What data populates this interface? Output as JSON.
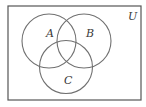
{
  "diagram": {
    "type": "venn",
    "universe": {
      "label": "U",
      "rect": {
        "x": 8,
        "y": 6,
        "width": 133,
        "height": 94
      },
      "stroke": "#555555"
    },
    "sets": [
      {
        "name": "A",
        "label": "A",
        "cx": 49,
        "cy": 41,
        "r": 27,
        "label_x": 46,
        "label_y": 37
      },
      {
        "name": "B",
        "label": "B",
        "cx": 84,
        "cy": 41,
        "r": 27,
        "label_x": 86,
        "label_y": 37
      },
      {
        "name": "C",
        "label": "C",
        "cx": 66,
        "cy": 67,
        "r": 26.5,
        "label_x": 64,
        "label_y": 84
      }
    ],
    "universe_label_pos": {
      "x": 128,
      "y": 20
    },
    "circle_stroke": "#707070"
  }
}
